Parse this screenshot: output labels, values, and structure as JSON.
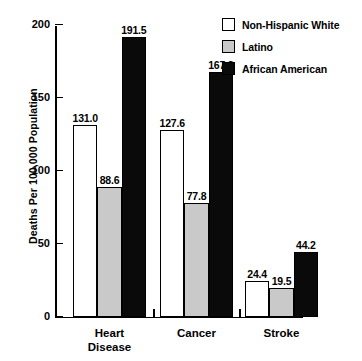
{
  "chart_data": {
    "type": "bar",
    "title": "",
    "xlabel": "",
    "ylabel": "Deaths Per 100,000 Population",
    "ylim": [
      0,
      200
    ],
    "yticks": [
      0,
      50,
      100,
      150,
      200
    ],
    "ytick_labels": [
      "0",
      "50",
      "100",
      "150",
      "200"
    ],
    "grid": false,
    "legend_position": "top-right",
    "categories": [
      "Heart Disease",
      "Cancer",
      "Stroke"
    ],
    "category_labels": [
      "Heart\nDisease",
      "Cancer",
      "Stroke"
    ],
    "series": [
      {
        "name": "Non-Hispanic White",
        "color": "#ffffff",
        "values": [
          131.0,
          127.6,
          24.4
        ],
        "value_labels": [
          "131.0",
          "127.6",
          "24.4"
        ]
      },
      {
        "name": "Latino",
        "color": "#c9c9c9",
        "values": [
          88.6,
          77.8,
          19.5
        ],
        "value_labels": [
          "88.6",
          "77.8",
          "19.5"
        ]
      },
      {
        "name": "African American",
        "color": "#0a0a0a",
        "values": [
          191.5,
          167.8,
          44.2
        ],
        "value_labels": [
          "191.5",
          "167.8",
          "44.2"
        ]
      }
    ]
  },
  "axis": {
    "y_title": "Deaths Per 100,000 Population"
  },
  "legend": {
    "entries": [
      {
        "label": "Non-Hispanic White",
        "swatch": "white"
      },
      {
        "label": "Latino",
        "swatch": "gray"
      },
      {
        "label": "African American",
        "swatch": "black"
      }
    ]
  }
}
